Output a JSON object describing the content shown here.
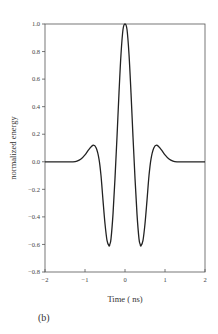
{
  "chart_data": {
    "type": "line",
    "title": "",
    "xlabel": "Time ( ns)",
    "ylabel": "normalized energy",
    "panel_label": "(b)",
    "xlim": [
      -2,
      2
    ],
    "ylim": [
      -0.8,
      1.0
    ],
    "grid": false,
    "legend": null,
    "xticks": [
      "-2",
      "-1",
      "0",
      "1",
      "2"
    ],
    "yticks": [
      "1.0",
      "0.8",
      "0.6",
      "0.4",
      "0.2",
      "0.0",
      "-0.2",
      "-0.4",
      "-0.6",
      "-0.8"
    ],
    "series": [
      {
        "name": "pulse",
        "color": "#222222",
        "x": [
          -2.0,
          -1.5,
          -1.3,
          -1.2,
          -1.1,
          -1.0,
          -0.9,
          -0.8,
          -0.72,
          -0.65,
          -0.6,
          -0.55,
          -0.5,
          -0.45,
          -0.4,
          -0.38,
          -0.35,
          -0.3,
          -0.25,
          -0.2,
          -0.15,
          -0.1,
          -0.05,
          0.0,
          0.05,
          0.1,
          0.15,
          0.2,
          0.25,
          0.3,
          0.35,
          0.38,
          0.4,
          0.45,
          0.5,
          0.55,
          0.6,
          0.65,
          0.72,
          0.8,
          0.9,
          1.0,
          1.1,
          1.2,
          1.3,
          1.5,
          2.0
        ],
        "y": [
          0.0,
          0.0,
          0.0,
          0.005,
          0.02,
          0.05,
          0.09,
          0.12,
          0.1,
          0.02,
          -0.1,
          -0.28,
          -0.45,
          -0.57,
          -0.61,
          -0.6,
          -0.56,
          -0.38,
          -0.12,
          0.18,
          0.5,
          0.78,
          0.96,
          1.0,
          0.96,
          0.78,
          0.5,
          0.18,
          -0.12,
          -0.38,
          -0.56,
          -0.6,
          -0.61,
          -0.57,
          -0.45,
          -0.28,
          -0.1,
          0.02,
          0.1,
          0.12,
          0.09,
          0.05,
          0.02,
          0.005,
          0.0,
          0.0,
          0.0
        ]
      }
    ]
  }
}
